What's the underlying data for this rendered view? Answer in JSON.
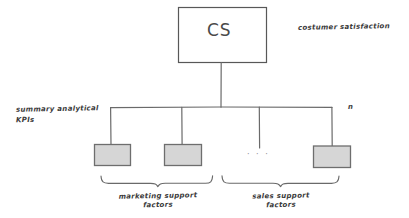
{
  "diagram": {
    "title_node": {
      "label": "CS",
      "annotation": "costumer satisfaction",
      "fill": "#ffffff",
      "stroke": "#555555"
    },
    "level_label": {
      "line1": "summary analytical",
      "line2": "KPIs"
    },
    "count_label": "n",
    "ellipsis": "· · ·",
    "child_nodes": [
      {
        "id": "child-1",
        "label": "",
        "fill": "#d6d6d6",
        "stroke": "#6e6e6e"
      },
      {
        "id": "child-2",
        "label": "",
        "fill": "#d6d6d6",
        "stroke": "#6e6e6e"
      },
      {
        "id": "child-n",
        "label": "",
        "fill": "#d6d6d6",
        "stroke": "#6e6e6e"
      }
    ],
    "groups": [
      {
        "id": "group-marketing",
        "line1": "marketing support",
        "line2": "factors"
      },
      {
        "id": "group-sales",
        "line1": "sales support",
        "line2": "factors"
      }
    ],
    "colors": {
      "background": "#ffffff",
      "ink": "#5a5a5a",
      "text": "#3a3a3a",
      "node_fill": "#d6d6d6"
    }
  }
}
